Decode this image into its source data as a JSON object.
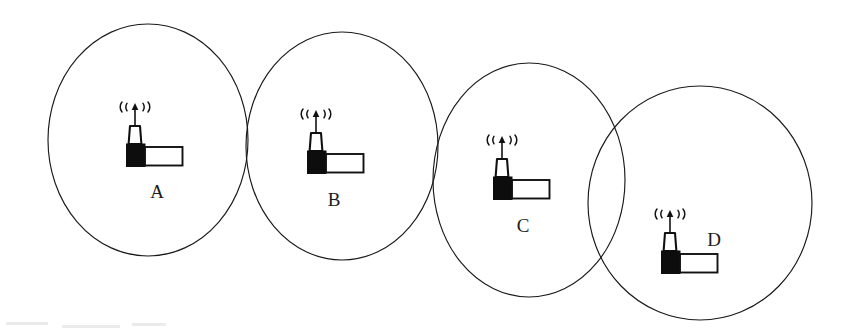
{
  "figure": {
    "background_color": "#ffffff",
    "line_color": "#1a1a1a",
    "fill_black": "#0d0d0d",
    "fill_white": "#ffffff",
    "width": 847,
    "height": 331
  },
  "diagram_data": {
    "type": "node-coverage-diagram",
    "description": "Four wireless nodes A, B, C, D each drawn at the centre-left of its own circular coverage area; adjacent coverage circles overlap pairwise in a descending chain from left to right.",
    "node_count": 4,
    "overlaps": [
      "A-B",
      "B-C",
      "C-D"
    ],
    "nodes": [
      {
        "label": "A",
        "circle": {
          "cx": 148,
          "cy": 140,
          "rx": 100,
          "ry": 116
        },
        "icon": {
          "x": 127,
          "y": 104
        },
        "label_pos": {
          "x": 157,
          "y": 194
        },
        "label_placement": "below"
      },
      {
        "label": "B",
        "circle": {
          "cx": 342,
          "cy": 146,
          "rx": 96,
          "ry": 114
        },
        "icon": {
          "x": 308,
          "y": 111
        },
        "label_pos": {
          "x": 334,
          "y": 202
        },
        "label_placement": "below"
      },
      {
        "label": "C",
        "circle": {
          "cx": 529,
          "cy": 180,
          "rx": 96,
          "ry": 117
        },
        "icon": {
          "x": 494,
          "y": 137
        },
        "label_pos": {
          "x": 523,
          "y": 228
        },
        "label_placement": "below"
      },
      {
        "label": "D",
        "circle": {
          "cx": 700,
          "cy": 203,
          "rx": 112,
          "ry": 117
        },
        "icon": {
          "x": 662,
          "y": 211
        },
        "label_pos": {
          "x": 714,
          "y": 242
        },
        "label_placement": "right"
      }
    ],
    "icon": {
      "name": "wireless-base-station-icon",
      "parts": [
        "antenna-waves",
        "antenna-mast",
        "tapered-body",
        "black-base-box",
        "white-side-rectangle"
      ],
      "base_box_size": {
        "w": 18,
        "h": 22
      },
      "side_rect_size": {
        "w": 37,
        "h": 18
      }
    }
  }
}
